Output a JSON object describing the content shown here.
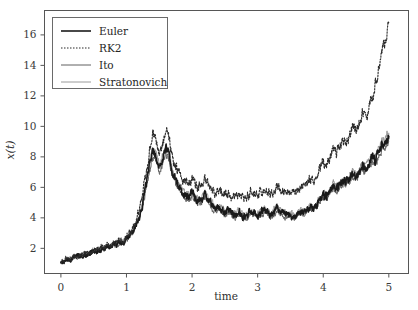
{
  "chart_data": {
    "type": "line",
    "title": "",
    "xlabel": "time",
    "ylabel": "x(t)",
    "xlim": [
      -0.25,
      5.3
    ],
    "ylim": [
      0.35,
      17.6
    ],
    "xticks": [
      0,
      1,
      2,
      3,
      4,
      5
    ],
    "xticklabels": [
      "0",
      "1",
      "2",
      "3",
      "4",
      "5"
    ],
    "yticks": [
      2,
      4,
      6,
      8,
      10,
      12,
      14,
      16
    ],
    "yticklabels": [
      "2",
      "4",
      "6",
      "8",
      "10",
      "12",
      "14",
      "16"
    ],
    "grid": false,
    "legend_position": "upper left",
    "legend_entries": [
      "Euler",
      "RK2",
      "Ito",
      "Stratonovich"
    ],
    "x": [
      0.0,
      0.05,
      0.1,
      0.15,
      0.2,
      0.25,
      0.3,
      0.35,
      0.4,
      0.45,
      0.5,
      0.55,
      0.6,
      0.65,
      0.7,
      0.75,
      0.8,
      0.85,
      0.9,
      0.95,
      1.0,
      1.05,
      1.1,
      1.15,
      1.2,
      1.25,
      1.3,
      1.35,
      1.4,
      1.45,
      1.5,
      1.55,
      1.6,
      1.65,
      1.7,
      1.75,
      1.8,
      1.85,
      1.9,
      1.95,
      2.0,
      2.05,
      2.1,
      2.15,
      2.2,
      2.25,
      2.3,
      2.35,
      2.4,
      2.45,
      2.5,
      2.55,
      2.6,
      2.65,
      2.7,
      2.75,
      2.8,
      2.85,
      2.9,
      2.95,
      3.0,
      3.05,
      3.1,
      3.15,
      3.2,
      3.25,
      3.3,
      3.35,
      3.4,
      3.45,
      3.5,
      3.55,
      3.6,
      3.65,
      3.7,
      3.75,
      3.8,
      3.85,
      3.9,
      3.95,
      4.0,
      4.05,
      4.1,
      4.15,
      4.2,
      4.25,
      4.3,
      4.35,
      4.4,
      4.45,
      4.5,
      4.55,
      4.6,
      4.65,
      4.7,
      4.75,
      4.8,
      4.85,
      4.9,
      4.95,
      5.0
    ],
    "series": [
      {
        "name": "Euler",
        "color": "#1a1a1a",
        "width": 1.6,
        "dash": "none",
        "values": [
          1.05,
          1.18,
          1.32,
          1.28,
          1.45,
          1.52,
          1.49,
          1.62,
          1.58,
          1.71,
          1.86,
          1.79,
          2.02,
          1.95,
          2.18,
          2.04,
          2.3,
          2.22,
          2.45,
          2.38,
          2.62,
          2.88,
          3.15,
          3.55,
          4.1,
          4.95,
          6.2,
          7.4,
          8.3,
          8.05,
          7.3,
          7.9,
          8.6,
          8.05,
          7.0,
          6.4,
          6.1,
          5.7,
          5.45,
          5.35,
          5.6,
          5.25,
          5.05,
          5.2,
          5.5,
          5.15,
          4.85,
          4.6,
          4.75,
          4.55,
          4.35,
          4.5,
          4.3,
          4.15,
          4.4,
          4.25,
          4.05,
          4.2,
          4.45,
          4.3,
          4.15,
          4.35,
          4.55,
          4.35,
          4.2,
          4.4,
          4.6,
          4.45,
          4.3,
          4.1,
          4.25,
          4.05,
          4.2,
          4.45,
          4.3,
          4.5,
          4.75,
          4.6,
          4.9,
          5.2,
          5.5,
          5.35,
          5.7,
          6.1,
          5.85,
          6.2,
          6.5,
          6.3,
          6.6,
          6.9,
          6.75,
          7.05,
          7.4,
          7.2,
          7.6,
          8.0,
          7.8,
          8.3,
          8.8,
          9.0,
          9.35
        ]
      },
      {
        "name": "RK2",
        "color": "#2a2a2a",
        "width": 1.1,
        "dash": "1.5,1.5",
        "values": [
          1.05,
          1.2,
          1.35,
          1.3,
          1.48,
          1.55,
          1.52,
          1.66,
          1.62,
          1.76,
          1.92,
          1.85,
          2.08,
          2.02,
          2.26,
          2.12,
          2.4,
          2.32,
          2.56,
          2.5,
          2.78,
          3.08,
          3.4,
          3.9,
          4.55,
          5.6,
          7.0,
          8.4,
          9.5,
          9.15,
          8.3,
          8.95,
          9.8,
          9.2,
          8.0,
          7.3,
          7.0,
          6.6,
          6.35,
          6.25,
          6.55,
          6.2,
          6.0,
          6.2,
          6.55,
          6.2,
          5.9,
          5.6,
          5.8,
          5.65,
          5.45,
          5.65,
          5.45,
          5.3,
          5.6,
          5.45,
          5.25,
          5.45,
          5.75,
          5.6,
          5.45,
          5.7,
          5.95,
          5.75,
          5.6,
          5.85,
          6.1,
          5.95,
          5.8,
          5.6,
          5.8,
          5.6,
          5.8,
          6.1,
          5.95,
          6.25,
          6.6,
          6.45,
          6.85,
          7.25,
          7.65,
          7.5,
          8.0,
          8.55,
          8.25,
          8.75,
          9.2,
          8.95,
          9.4,
          9.9,
          9.7,
          10.25,
          10.8,
          10.55,
          11.3,
          12.1,
          12.9,
          13.9,
          15.0,
          15.7,
          16.8
        ]
      },
      {
        "name": "Ito",
        "color": "#606060",
        "width": 1.0,
        "dash": "none",
        "values": [
          1.05,
          1.17,
          1.3,
          1.26,
          1.43,
          1.5,
          1.47,
          1.6,
          1.56,
          1.68,
          1.83,
          1.76,
          1.98,
          1.91,
          2.14,
          2.0,
          2.25,
          2.18,
          2.4,
          2.33,
          2.56,
          2.8,
          3.06,
          3.45,
          3.98,
          4.8,
          6.0,
          7.15,
          8.0,
          7.78,
          7.05,
          7.62,
          8.3,
          7.78,
          6.78,
          6.2,
          5.9,
          5.52,
          5.28,
          5.18,
          5.42,
          5.08,
          4.88,
          5.03,
          5.32,
          4.98,
          4.7,
          4.45,
          4.6,
          4.4,
          4.2,
          4.35,
          4.16,
          4.02,
          4.26,
          4.12,
          3.92,
          4.06,
          4.3,
          4.16,
          4.02,
          4.2,
          4.4,
          4.2,
          4.06,
          4.26,
          4.45,
          4.3,
          4.16,
          3.97,
          4.1,
          3.92,
          4.06,
          4.3,
          4.16,
          4.35,
          4.6,
          4.45,
          4.75,
          5.04,
          5.32,
          5.18,
          5.52,
          5.9,
          5.66,
          6.0,
          6.3,
          6.1,
          6.38,
          6.68,
          6.54,
          6.82,
          7.16,
          6.97,
          7.35,
          7.74,
          7.55,
          8.03,
          8.5,
          8.7,
          9.05
        ]
      },
      {
        "name": "Stratonovich",
        "color": "#9a9a9a",
        "width": 1.0,
        "dash": "none",
        "values": [
          1.05,
          1.19,
          1.33,
          1.29,
          1.47,
          1.54,
          1.51,
          1.64,
          1.6,
          1.73,
          1.88,
          1.81,
          2.05,
          1.98,
          2.21,
          2.07,
          2.33,
          2.26,
          2.49,
          2.42,
          2.66,
          2.93,
          3.2,
          3.62,
          4.18,
          5.05,
          6.32,
          7.55,
          8.45,
          8.2,
          7.45,
          8.05,
          8.78,
          8.2,
          7.15,
          6.52,
          6.22,
          5.82,
          5.56,
          5.46,
          5.72,
          5.36,
          5.15,
          5.3,
          5.62,
          5.26,
          4.95,
          4.7,
          4.86,
          4.65,
          4.44,
          4.6,
          4.4,
          4.24,
          4.5,
          4.35,
          4.14,
          4.29,
          4.55,
          4.4,
          4.24,
          4.45,
          4.65,
          4.45,
          4.29,
          4.5,
          4.7,
          4.55,
          4.4,
          4.19,
          4.35,
          4.14,
          4.29,
          4.55,
          4.4,
          4.6,
          4.86,
          4.7,
          5.01,
          5.32,
          5.62,
          5.47,
          5.83,
          6.24,
          5.98,
          6.34,
          6.65,
          6.44,
          6.75,
          7.06,
          6.9,
          7.2,
          7.56,
          7.36,
          7.77,
          8.18,
          7.97,
          8.48,
          9.0,
          9.2,
          9.55
        ]
      }
    ],
    "noise_detail": {
      "seed": 7321,
      "substeps": 11,
      "amplitudes": {
        "Euler": 0.12,
        "RK2": 0.14,
        "Ito": 0.1,
        "Stratonovich": 0.11
      }
    }
  },
  "figure": {
    "background": "#ffffff",
    "frame_color": "#565656",
    "legend_border": "#6a6a6a"
  }
}
